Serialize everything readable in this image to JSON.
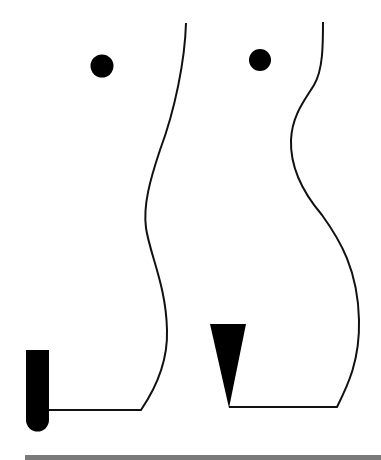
{
  "diagram": {
    "figures": [
      {
        "id": "left-figure",
        "marker_shape": "rounded-bar",
        "head_marker": "dot"
      },
      {
        "id": "right-figure",
        "marker_shape": "inverted-triangle",
        "head_marker": "dot"
      }
    ],
    "colors": {
      "stroke": "#111111",
      "fill": "#000000",
      "ground": "#7a7a7a",
      "background": "#ffffff"
    }
  }
}
